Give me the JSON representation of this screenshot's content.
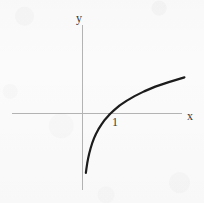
{
  "figure": {
    "kind": "cartesian-function-plot",
    "background_color": "#fbfbfc",
    "width": 204,
    "height": 203
  },
  "axes": {
    "x_axis_label": "x",
    "y_axis_label": "y",
    "axis_color": "#b4b4b4",
    "origin_px": [
      82,
      113
    ],
    "unit_px": 28,
    "x_axis_extent_px": [
      12,
      182
    ],
    "y_axis_extent_px": [
      25,
      190
    ]
  },
  "ticks": {
    "x": [
      {
        "label": "1",
        "value": 1
      }
    ],
    "y": []
  },
  "chart_data": {
    "type": "line",
    "title": "",
    "subtitle": "",
    "xlabel": "x",
    "ylabel": "y",
    "grid": false,
    "legend": "none",
    "xlim": [
      -2.5,
      3.6
    ],
    "ylim": [
      -2.3,
      2.8
    ],
    "xticks": [
      1
    ],
    "xticklabels": [
      "1"
    ],
    "yticks": [],
    "yticklabels": [],
    "annotations": [],
    "series": [
      {
        "name": "y = ln(x)",
        "color": "#1c1c1c",
        "linewidth": 2.2,
        "x": [
          0.12,
          0.14,
          0.17,
          0.2,
          0.24,
          0.29,
          0.34,
          0.41,
          0.48,
          0.57,
          0.68,
          0.8,
          0.95,
          1.0,
          1.12,
          1.33,
          1.57,
          1.86,
          2.2,
          2.6,
          3.08,
          3.64
        ],
        "y": [
          -2.12,
          -1.97,
          -1.77,
          -1.61,
          -1.43,
          -1.24,
          -1.08,
          -0.89,
          -0.73,
          -0.56,
          -0.39,
          -0.22,
          -0.05,
          0.0,
          0.11,
          0.29,
          0.45,
          0.62,
          0.79,
          0.96,
          1.12,
          1.29
        ]
      }
    ]
  }
}
